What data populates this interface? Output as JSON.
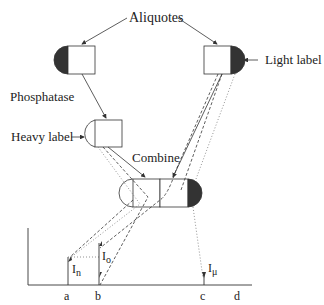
{
  "labels": {
    "aliquotes": "Aliquotes",
    "light_label": "Light label",
    "phosphatase": "Phosphatase",
    "heavy_label": "Heavy label",
    "combine": "Combine"
  },
  "axis": {
    "ticks": [
      "a",
      "b",
      "c",
      "d"
    ],
    "peaks": {
      "n": "I",
      "n_sub": "n",
      "o": "I",
      "o_sub": "o",
      "mu": "I",
      "mu_sub": "μ"
    }
  },
  "colors": {
    "line": "#333333",
    "fill_dark": "#333333",
    "dotted": "#777777"
  }
}
